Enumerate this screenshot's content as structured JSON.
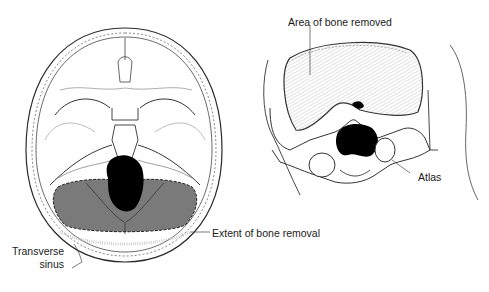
{
  "figures": [
    {
      "id": "left",
      "view": "superior view of skull base",
      "labels": {
        "transverse_sinus_line1": "Transverse",
        "transverse_sinus_line2": "sinus",
        "extent_of_bone_removal": "Extent of bone removal"
      }
    },
    {
      "id": "right",
      "view": "posterior oblique view of occiput",
      "labels": {
        "area_of_bone_removed": "Area of bone removed",
        "atlas": "Atlas"
      }
    }
  ],
  "colors": {
    "line": "#2a2a2a",
    "faint_line": "#9a9a9a",
    "removal_fill": "#7a7a7a",
    "foramen": "#000000",
    "hatch": "#b8b8b8"
  }
}
